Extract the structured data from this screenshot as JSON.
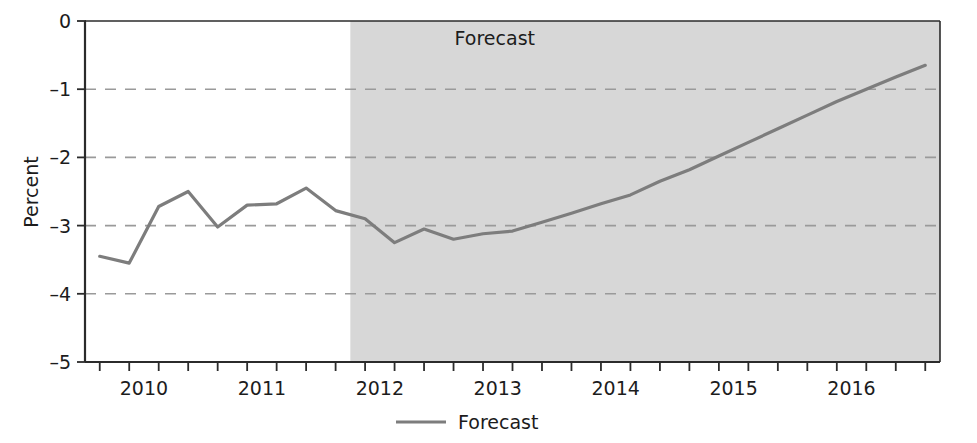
{
  "chart_data": {
    "type": "line",
    "title": "",
    "xlabel": "",
    "ylabel": "Percent",
    "ylim": [
      -5,
      0
    ],
    "xlim": [
      2009.625,
      2016.875
    ],
    "grid": true,
    "y_ticks": [
      "0",
      "-1",
      "-2",
      "-3",
      "-4",
      "-5"
    ],
    "y_tick_values": [
      0,
      -1,
      -2,
      -3,
      -4,
      -5
    ],
    "x_ticks": [
      "2010",
      "2011",
      "2012",
      "2013",
      "2014",
      "2015",
      "2016"
    ],
    "x_tick_values": [
      2010,
      2011,
      2012,
      2013,
      2014,
      2015,
      2016
    ],
    "legend": {
      "position": "bottom-center",
      "entries": [
        {
          "name": "Forecast",
          "color": "#7d7d7d",
          "marker": "line"
        }
      ]
    },
    "annotations": [
      {
        "text": "Forecast",
        "x": 2013.1,
        "y": -0.35,
        "region": "shaded"
      }
    ],
    "shaded_region": {
      "label": "Forecast",
      "x_start": 2011.875,
      "x_end": 2016.875,
      "color": "#d7d7d7"
    },
    "series": [
      {
        "name": "Forecast",
        "color": "#7d7d7d",
        "x": [
          2009.75,
          2010.0,
          2010.25,
          2010.5,
          2010.75,
          2011.0,
          2011.25,
          2011.5,
          2011.75,
          2012.0,
          2012.25,
          2012.5,
          2012.75,
          2013.0,
          2013.25,
          2013.5,
          2013.75,
          2014.0,
          2014.25,
          2014.5,
          2014.75,
          2015.0,
          2015.25,
          2015.5,
          2015.75,
          2016.0,
          2016.25,
          2016.5,
          2016.75
        ],
        "values": [
          -3.45,
          -3.55,
          -2.72,
          -2.5,
          -3.02,
          -2.7,
          -2.68,
          -2.45,
          -2.78,
          -2.9,
          -3.25,
          -3.05,
          -3.2,
          -3.12,
          -3.08,
          -2.95,
          -2.82,
          -2.68,
          -2.55,
          -2.35,
          -2.18,
          -1.98,
          -1.78,
          -1.58,
          -1.38,
          -1.18,
          -1.0,
          -0.82,
          -0.65
        ]
      }
    ]
  },
  "axis": {
    "y_label": "Percent"
  },
  "colors": {
    "line": "#7d7d7d",
    "shade": "#d7d7d7",
    "grid": "#9a9a9a",
    "axis": "#2b2b2b",
    "text": "#1c1c1c"
  }
}
